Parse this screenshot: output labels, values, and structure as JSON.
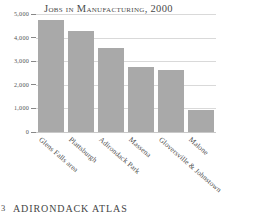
{
  "chart_data": {
    "type": "bar",
    "title": "Jobs in Manufacturing, 2000",
    "xlabel": "",
    "ylabel": "",
    "ylim": [
      0,
      5000
    ],
    "grid": true,
    "legend": "none",
    "categories": [
      "Glens Falls area",
      "Plattsburgh",
      "Adirondack Park",
      "Massena",
      "Gloversville & Johnstown",
      "Malone"
    ],
    "values": [
      4750,
      4280,
      3550,
      2770,
      2630,
      950
    ],
    "ytick_labels": [
      "5,000",
      "4,000",
      "3,000",
      "2,000",
      "1,000",
      "0"
    ],
    "ytick_values": [
      5000,
      4000,
      3000,
      2000,
      1000,
      0
    ],
    "bar_color": "#a9a9a9",
    "gridline_color": "#d9d9d9"
  },
  "footer": {
    "page_number": "3",
    "title": "ADIRONDACK ATLAS"
  }
}
